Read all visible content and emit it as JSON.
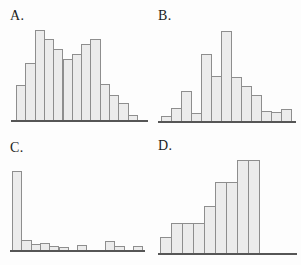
{
  "figure": {
    "background": "#fdfdfd",
    "bar_fill": "#ececec",
    "bar_border": "#8e8e8e",
    "baseline_color": "#565656",
    "label_color": "#1c1c1c"
  },
  "chart_data": [
    {
      "type": "bar",
      "label": "A.",
      "description_type": "histogram",
      "values": [
        0.39,
        0.63,
        1.0,
        0.9,
        0.79,
        0.68,
        0.73,
        0.84,
        0.9,
        0.4,
        0.28,
        0.19,
        0.06
      ],
      "title": "",
      "xlabel": "",
      "ylabel": "",
      "axis_ticks": "none",
      "layout": {
        "left": 11,
        "baseline_y": 120,
        "width": 137,
        "peak_height": 90,
        "bar_width": 9.3,
        "bars_offset": 5,
        "label_x": 10,
        "label_y": 9
      }
    },
    {
      "type": "bar",
      "label": "B.",
      "description_type": "histogram",
      "values": [
        0.06,
        0.14,
        0.33,
        0.09,
        0.74,
        0.5,
        1.0,
        0.49,
        0.39,
        0.29,
        0.11,
        0.1,
        0.13
      ],
      "title": "",
      "xlabel": "",
      "ylabel": "",
      "axis_ticks": "none",
      "layout": {
        "left": 158,
        "baseline_y": 121,
        "width": 138,
        "peak_height": 90,
        "bar_width": 10,
        "bars_offset": 3,
        "label_x": 158,
        "label_y": 9
      }
    },
    {
      "type": "bar",
      "label": "C.",
      "description_type": "histogram",
      "values": [
        1.0,
        0.13,
        0.08,
        0.09,
        0.045,
        0.04,
        0,
        0.06,
        0,
        0,
        0.12,
        0.05,
        0,
        0.05
      ],
      "title": "",
      "xlabel": "",
      "ylabel": "",
      "axis_ticks": "none",
      "layout": {
        "left": 10,
        "baseline_y": 250,
        "width": 135,
        "peak_height": 79,
        "bar_width": 9.3,
        "bars_offset": 2,
        "label_x": 10,
        "label_y": 141
      }
    },
    {
      "type": "bar",
      "label": "D.",
      "description_type": "histogram",
      "values": [
        0.17,
        0.32,
        0.32,
        0.32,
        0.51,
        0.76,
        0.76,
        1.0,
        1.0
      ],
      "title": "",
      "xlabel": "",
      "ylabel": "",
      "axis_ticks": "none",
      "layout": {
        "left": 158,
        "baseline_y": 253,
        "width": 139,
        "peak_height": 93,
        "bar_width": 11,
        "bars_offset": 2,
        "label_x": 158,
        "label_y": 139
      }
    }
  ]
}
